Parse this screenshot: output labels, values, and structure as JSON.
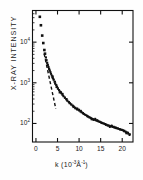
{
  "figure": {
    "name": "x-ray-intensity-scattering-plot",
    "background": "#fefefe",
    "ink_color": "#111111"
  },
  "axes": {
    "y_title": "X-RAY INTENSITY",
    "x_title_prefix": "k (10",
    "x_title_exp1": "-3",
    "x_title_mid": "Å",
    "x_title_exp2": "-1",
    "x_title_suffix": ")",
    "x_title_plain": "k (10-3Å-1)",
    "y_ticks": [
      {
        "label_base": "10",
        "label_exp": "4",
        "value": 10000
      },
      {
        "label_base": "10",
        "label_exp": "3",
        "value": 1000
      },
      {
        "label_base": "10",
        "label_exp": "2",
        "value": 100
      }
    ],
    "x_ticks": [
      {
        "label": "0",
        "value": 0
      },
      {
        "label": "5",
        "value": 5
      },
      {
        "label": "10",
        "value": 10
      },
      {
        "label": "15",
        "value": 15
      },
      {
        "label": "20",
        "value": 20
      }
    ]
  },
  "chart_data": {
    "type": "scatter",
    "title": "",
    "xlabel": "k (10^-3 Å^-1)",
    "ylabel": "X-RAY INTENSITY",
    "yscale": "log",
    "xscale": "linear",
    "xlim": [
      -0.8,
      22.5
    ],
    "ylim": [
      35,
      60000
    ],
    "grid": false,
    "legend": null,
    "marker": "square",
    "marker_color": "#111111",
    "series": [
      {
        "name": "X-ray scattering intensity",
        "x": [
          0.9,
          1.15,
          1.45,
          1.7,
          1.95,
          2.1,
          2.3,
          2.45,
          2.6,
          2.75,
          2.9,
          3.05,
          3.2,
          3.35,
          3.5,
          3.65,
          3.8,
          3.95,
          4.1,
          4.3,
          4.5,
          4.7,
          4.9,
          5.1,
          5.35,
          5.6,
          5.85,
          6.1,
          6.4,
          6.7,
          7.0,
          7.3,
          7.6,
          7.9,
          8.2,
          8.5,
          8.8,
          9.1,
          9.4,
          9.7,
          10.0,
          10.3,
          10.6,
          10.9,
          11.2,
          11.5,
          11.8,
          12.1,
          12.4,
          12.7,
          13.0,
          13.3,
          13.6,
          13.9,
          14.2,
          14.5,
          14.8,
          15.1,
          15.4,
          15.7,
          16.0,
          16.3,
          16.6,
          16.9,
          17.2,
          17.5,
          17.8,
          18.1,
          18.4,
          18.7,
          19.0,
          19.3,
          19.6,
          19.9,
          20.2,
          20.5,
          20.8,
          21.1,
          21.4,
          21.7
        ],
        "y": [
          42000,
          26000,
          14500,
          9500,
          6400,
          5200,
          4200,
          3600,
          3100,
          2750,
          2450,
          2200,
          2000,
          1820,
          1660,
          1520,
          1400,
          1290,
          1190,
          1060,
          960,
          880,
          800,
          735,
          665,
          605,
          555,
          510,
          465,
          425,
          392,
          362,
          338,
          315,
          295,
          277,
          260,
          245,
          232,
          220,
          208,
          197,
          187,
          178,
          170,
          162,
          155,
          149,
          143,
          137,
          131,
          128,
          123,
          119,
          116,
          112,
          109,
          105,
          102,
          100,
          97,
          94,
          91,
          89,
          86,
          84,
          82,
          80,
          78,
          76,
          75,
          73,
          71,
          70,
          68,
          66,
          63,
          60,
          56,
          52
        ]
      }
    ],
    "annotations": [
      {
        "name": "dashed-guide-line",
        "type": "dashed-line",
        "style": "dashed",
        "x": [
          1.9,
          4.6
        ],
        "y": [
          5200,
          230
        ]
      }
    ]
  }
}
